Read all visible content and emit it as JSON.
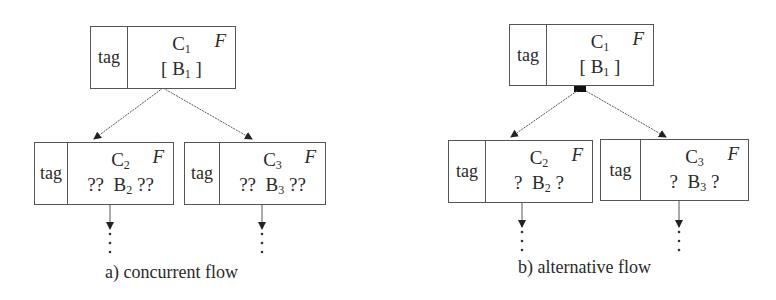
{
  "diagrams": [
    {
      "caption": "a) concurrent flow",
      "parent": {
        "tag": "tag",
        "name": "C",
        "name_sub": "1",
        "content": "[ B",
        "content_sub": "1",
        "content_after": " ]",
        "flag": "F"
      },
      "children": [
        {
          "tag": "tag",
          "name": "C",
          "name_sub": "2",
          "content": "??  B",
          "content_sub": "2",
          "content_after": " ??",
          "flag": "F",
          "continuation": "⋮"
        },
        {
          "tag": "tag",
          "name": "C",
          "name_sub": "3",
          "content": "??  B",
          "content_sub": "3",
          "content_after": " ??",
          "flag": "F",
          "continuation": "⋮"
        }
      ],
      "split_marker": "none"
    },
    {
      "caption": "b) alternative flow",
      "parent": {
        "tag": "tag",
        "name": "C",
        "name_sub": "1",
        "content": "[ B",
        "content_sub": "1",
        "content_after": " ]",
        "flag": "F"
      },
      "children": [
        {
          "tag": "tag",
          "name": "C",
          "name_sub": "2",
          "content": "?  B",
          "content_sub": "2",
          "content_after": " ?",
          "flag": "F",
          "continuation": "⋮"
        },
        {
          "tag": "tag",
          "name": "C",
          "name_sub": "3",
          "content": "?  B",
          "content_sub": "3",
          "content_after": " ?",
          "flag": "F",
          "continuation": "⋮"
        }
      ],
      "split_marker": "filled-square"
    }
  ],
  "colors": {
    "line": "#555555",
    "text": "#2a2a2a",
    "marker": "#111111"
  }
}
